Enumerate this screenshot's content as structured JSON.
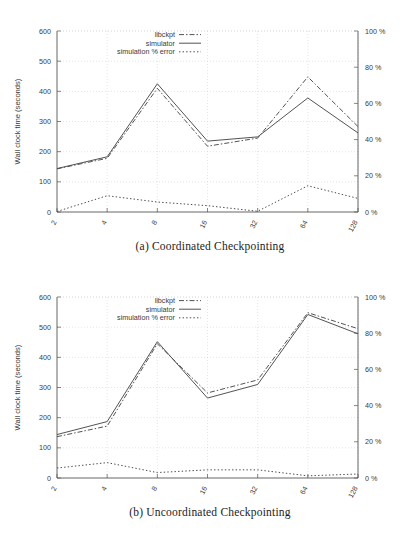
{
  "figure_a": {
    "caption": "(a) Coordinated Checkpointing",
    "chart_data": {
      "type": "line",
      "title": "",
      "xlabel": "Nodes",
      "ylabel": "Wall clock time (seconds)",
      "y2label": "",
      "categories": [
        "2",
        "4",
        "8",
        "16",
        "32",
        "64",
        "128"
      ],
      "ylim": [
        0,
        600
      ],
      "yticks": [
        "0",
        "100",
        "200",
        "300",
        "400",
        "500",
        "600"
      ],
      "y2lim": [
        0,
        100
      ],
      "y2ticks": [
        "0 %",
        "20 %",
        "40 %",
        "60 %",
        "80 %",
        "100 %"
      ],
      "grid": true,
      "legend_position": "top-center",
      "series": [
        {
          "name": "libckpt",
          "axis": "left",
          "style": "dashdot",
          "values": [
            143,
            178,
            410,
            218,
            245,
            448,
            283
          ]
        },
        {
          "name": "simulator",
          "axis": "left",
          "style": "solid",
          "values": [
            144,
            183,
            425,
            235,
            249,
            378,
            262
          ]
        },
        {
          "name": "simulation % error",
          "axis": "right",
          "style": "dotted",
          "values": [
            0.3,
            9.0,
            5.5,
            3.5,
            0.4,
            14.5,
            7.5
          ]
        }
      ]
    }
  },
  "figure_b": {
    "caption": "(b) Uncoordinated Checkpointing",
    "chart_data": {
      "type": "line",
      "title": "",
      "xlabel": "Nodes",
      "ylabel": "Wall clock time (seconds)",
      "y2label": "",
      "categories": [
        "2",
        "4",
        "8",
        "16",
        "32",
        "64",
        "128"
      ],
      "ylim": [
        0,
        600
      ],
      "yticks": [
        "0",
        "100",
        "200",
        "300",
        "400",
        "500",
        "600"
      ],
      "y2lim": [
        0,
        100
      ],
      "y2ticks": [
        "0 %",
        "20 %",
        "40 %",
        "60 %",
        "80 %",
        "100 %"
      ],
      "grid": true,
      "legend_position": "top-center",
      "series": [
        {
          "name": "libckpt",
          "axis": "left",
          "style": "dashdot",
          "values": [
            137,
            172,
            445,
            282,
            325,
            548,
            495
          ]
        },
        {
          "name": "simulator",
          "axis": "left",
          "style": "solid",
          "values": [
            144,
            187,
            452,
            265,
            310,
            542,
            478
          ]
        },
        {
          "name": "simulation % error",
          "axis": "right",
          "style": "dotted",
          "values": [
            5.5,
            8.5,
            3.0,
            4.5,
            4.5,
            1.2,
            2.2
          ]
        }
      ]
    }
  },
  "colors": {
    "line": "#4a4a4a",
    "grid": "#c9c9d6",
    "axis": "#555555",
    "text": "#3a3a3a"
  }
}
